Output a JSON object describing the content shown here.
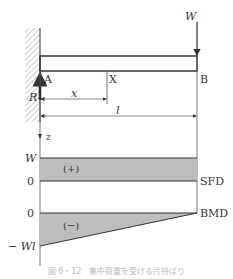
{
  "diagram": {
    "type": "cantilever beam with point load, shear force and bending moment diagrams",
    "colors": {
      "line": "#333333",
      "fill": "#bdbdbd",
      "hatch": "#999999"
    },
    "beam": {
      "load_label": "W",
      "reaction_label": "R",
      "points": {
        "fixed_end": "A",
        "section": "X",
        "free_end": "B"
      },
      "dim_x": "x",
      "dim_l": "l",
      "axis_label": "z"
    },
    "sfd": {
      "name": "SFD",
      "top_label": "W",
      "zero_label": "0",
      "sign": "(+)"
    },
    "bmd": {
      "name": "BMD",
      "zero_label": "0",
      "bottom_label": "− Wl",
      "sign": "(−)"
    },
    "caption": "図 6・12　集中荷重を受ける片持ばり"
  }
}
